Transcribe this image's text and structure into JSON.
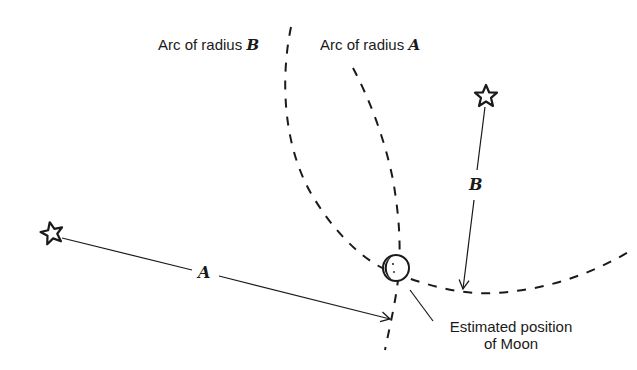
{
  "diagram": {
    "labels": {
      "arc_b_prefix": "Arc of radius ",
      "arc_b_var": "B",
      "arc_a_prefix": "Arc of radius ",
      "arc_a_var": "A",
      "segment_a": "A",
      "segment_b": "B",
      "moon_line1": "Estimated position",
      "moon_line2": "of Moon"
    },
    "elements": {
      "star_a": "star-icon",
      "star_b": "star-icon",
      "moon": "crescent-moon-icon"
    },
    "colors": {
      "ink": "#1a1a1a",
      "background": "#ffffff"
    }
  }
}
